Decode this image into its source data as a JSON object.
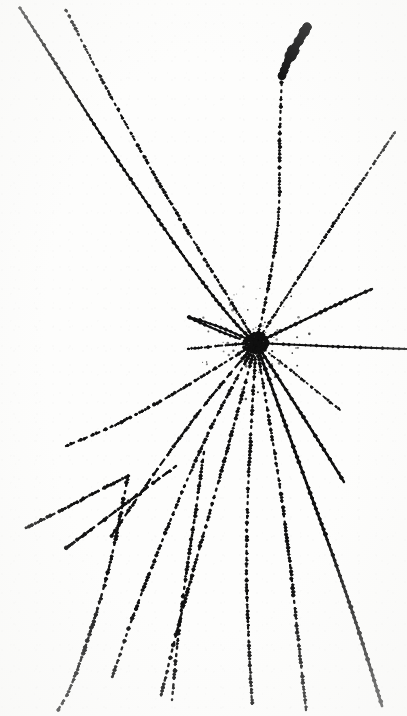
{
  "image": {
    "kind": "bubble-chamber-photograph",
    "title": "Bubble chamber particle interaction event",
    "width": 407,
    "height": 716,
    "background_color": "#fdfdfc",
    "ink_color": "#101010",
    "caption": ""
  },
  "vertex": {
    "label": "primary-interaction-vertex",
    "x": 256,
    "y": 343,
    "radius": 13
  },
  "chart_data": {
    "type": "scatter",
    "xlabel": "",
    "ylabel": "",
    "xlim": [
      0,
      407
    ],
    "ylim": [
      0,
      716
    ],
    "grid": false,
    "legend": "none",
    "annotations": [
      {
        "name": "primary-vertex",
        "x": 256,
        "y": 343
      }
    ],
    "series": [
      {
        "name": "incoming-beam-track-solid-upper-left",
        "style": "solid",
        "width": 2.2,
        "points": [
          [
            20,
            8
          ],
          [
            46,
            48
          ],
          [
            96,
            128
          ],
          [
            150,
            208
          ],
          [
            200,
            280
          ],
          [
            238,
            327
          ],
          [
            256,
            343
          ]
        ]
      },
      {
        "name": "incoming-track-dotted-upper-left",
        "style": "dotted",
        "width": 2.1,
        "points": [
          [
            66,
            10
          ],
          [
            84,
            46
          ],
          [
            118,
            110
          ],
          [
            158,
            182
          ],
          [
            200,
            252
          ],
          [
            236,
            310
          ],
          [
            256,
            343
          ]
        ]
      },
      {
        "name": "thick-stub-track-top-center",
        "style": "blob",
        "width": 7.0,
        "points": [
          [
            307,
            27
          ],
          [
            297,
            44
          ],
          [
            288,
            60
          ],
          [
            282,
            76
          ]
        ]
      },
      {
        "name": "vertical-dotted-track-upper-center",
        "style": "dotted",
        "width": 2.2,
        "points": [
          [
            282,
            76
          ],
          [
            279,
            140
          ],
          [
            280,
            208
          ],
          [
            273,
            262
          ],
          [
            264,
            310
          ],
          [
            256,
            343
          ]
        ]
      },
      {
        "name": "dotted-track-upper-right",
        "style": "dotted",
        "width": 2.0,
        "points": [
          [
            256,
            343
          ],
          [
            300,
            276
          ],
          [
            340,
            214
          ],
          [
            372,
            166
          ],
          [
            395,
            132
          ]
        ]
      },
      {
        "name": "solid-track-right-upper",
        "style": "solid",
        "width": 2.4,
        "points": [
          [
            256,
            343
          ],
          [
            300,
            322
          ],
          [
            340,
            303
          ],
          [
            372,
            289
          ]
        ]
      },
      {
        "name": "near-horizontal-track-right",
        "style": "solid",
        "width": 1.9,
        "points": [
          [
            256,
            343
          ],
          [
            300,
            345
          ],
          [
            345,
            347
          ],
          [
            407,
            349
          ]
        ]
      },
      {
        "name": "short-track-left-upper",
        "style": "solid",
        "width": 2.3,
        "points": [
          [
            256,
            343
          ],
          [
            228,
            330
          ],
          [
            200,
            320
          ],
          [
            188,
            317
          ]
        ]
      },
      {
        "name": "short-dash-track-left",
        "style": "dashed",
        "width": 2.0,
        "points": [
          [
            256,
            343
          ],
          [
            226,
            345
          ],
          [
            200,
            348
          ],
          [
            188,
            349
          ]
        ]
      },
      {
        "name": "long-track-lower-left",
        "style": "dotted",
        "width": 2.2,
        "points": [
          [
            256,
            343
          ],
          [
            210,
            372
          ],
          [
            160,
            402
          ],
          [
            110,
            428
          ],
          [
            66,
            446
          ]
        ]
      },
      {
        "name": "dashed-track-lower-left-steep",
        "style": "dashed",
        "width": 2.2,
        "points": [
          [
            256,
            343
          ],
          [
            214,
            392
          ],
          [
            175,
            444
          ],
          [
            140,
            494
          ],
          [
            110,
            538
          ]
        ]
      },
      {
        "name": "dotted-track-to-bottom-left-a",
        "style": "dotted",
        "width": 2.3,
        "points": [
          [
            256,
            343
          ],
          [
            222,
            404
          ],
          [
            190,
            472
          ],
          [
            160,
            546
          ],
          [
            132,
            618
          ],
          [
            112,
            678
          ]
        ]
      },
      {
        "name": "dotted-track-to-bottom-left-b",
        "style": "dotted",
        "width": 2.4,
        "points": [
          [
            256,
            343
          ],
          [
            238,
            410
          ],
          [
            218,
            484
          ],
          [
            196,
            560
          ],
          [
            176,
            634
          ],
          [
            160,
            700
          ]
        ]
      },
      {
        "name": "dotted-track-near-vertical-center",
        "style": "dotted",
        "width": 2.2,
        "points": [
          [
            256,
            343
          ],
          [
            252,
            412
          ],
          [
            248,
            486
          ],
          [
            246,
            560
          ],
          [
            248,
            632
          ],
          [
            252,
            704
          ]
        ]
      },
      {
        "name": "dotted-track-bottom-center-right",
        "style": "dotted",
        "width": 2.3,
        "points": [
          [
            256,
            343
          ],
          [
            268,
            412
          ],
          [
            280,
            486
          ],
          [
            290,
            562
          ],
          [
            298,
            638
          ],
          [
            306,
            710
          ]
        ]
      },
      {
        "name": "solid-track-bottom-right-long",
        "style": "solid",
        "width": 2.6,
        "points": [
          [
            256,
            343
          ],
          [
            280,
            410
          ],
          [
            306,
            482
          ],
          [
            334,
            558
          ],
          [
            360,
            634
          ],
          [
            382,
            706
          ]
        ]
      },
      {
        "name": "solid-track-lower-right-short",
        "style": "solid",
        "width": 2.4,
        "points": [
          [
            256,
            343
          ],
          [
            286,
            390
          ],
          [
            318,
            440
          ],
          [
            344,
            482
          ]
        ]
      },
      {
        "name": "faint-dotted-track-lower-right",
        "style": "dotted",
        "width": 1.7,
        "points": [
          [
            256,
            343
          ],
          [
            288,
            368
          ],
          [
            318,
            392
          ],
          [
            340,
            410
          ]
        ]
      },
      {
        "name": "orphan-dashed-track-left-mid",
        "style": "dashed",
        "width": 2.2,
        "points": [
          [
            26,
            528
          ],
          [
            62,
            510
          ],
          [
            100,
            490
          ],
          [
            128,
            476
          ]
        ]
      },
      {
        "name": "orphan-dotted-track-left-bottom",
        "style": "dotted",
        "width": 2.4,
        "points": [
          [
            128,
            476
          ],
          [
            118,
            530
          ],
          [
            104,
            588
          ],
          [
            88,
            640
          ],
          [
            70,
            690
          ],
          [
            58,
            710
          ]
        ]
      },
      {
        "name": "orphan-dashed-track-left-lower-diagonal",
        "style": "dashed",
        "width": 2.4,
        "points": [
          [
            66,
            548
          ],
          [
            104,
            520
          ],
          [
            144,
            490
          ],
          [
            176,
            466
          ]
        ]
      },
      {
        "name": "orphan-dotted-track-right-of-center-bottom",
        "style": "dotted",
        "width": 2.4,
        "points": [
          [
            204,
            452
          ],
          [
            196,
            510
          ],
          [
            186,
            574
          ],
          [
            178,
            636
          ],
          [
            172,
            700
          ]
        ]
      },
      {
        "name": "stub-track-upper-left-of-vertex",
        "style": "solid",
        "width": 2.0,
        "points": [
          [
            190,
            318
          ],
          [
            216,
            330
          ],
          [
            240,
            339
          ]
        ]
      }
    ]
  }
}
